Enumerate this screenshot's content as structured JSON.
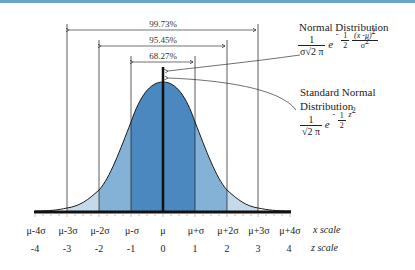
{
  "diagram": {
    "colors": {
      "band_1sigma": "#4a88bf",
      "band_2sigma": "#84b1d6",
      "band_3sigma": "#c4daea",
      "curve": "#1a1a1a",
      "top_border": "#6aa7c7"
    },
    "intervals": [
      {
        "label": "99.73%",
        "range": "μ±3σ"
      },
      {
        "label": "95.45%",
        "range": "μ±2σ"
      },
      {
        "label": "68.27%",
        "range": "μ±σ"
      }
    ],
    "x_scale": {
      "name": "x scale",
      "ticks": [
        "μ-4σ",
        "μ-3σ",
        "μ-2σ",
        "μ-σ",
        "μ",
        "μ+σ",
        "μ+2σ",
        "μ+3σ",
        "μ+4σ"
      ]
    },
    "z_scale": {
      "name": "z scale",
      "ticks": [
        "-4",
        "-3",
        "-2",
        "-1",
        "0",
        "1",
        "2",
        "3",
        "4"
      ]
    },
    "normal": {
      "title": "Normal Distribution",
      "num": "1",
      "den": "σ√2 π",
      "e": "e",
      "exp_sign": "-",
      "exp_frac_num": "1",
      "exp_frac_den": "2",
      "exp_num": "(x -μ)",
      "exp_num_pow": "2",
      "exp_den": "σ",
      "exp_den_pow": "2"
    },
    "standard": {
      "title_line1": "Standard Normal",
      "title_line2": "Distribution",
      "num": "1",
      "den": "√2 π",
      "e": "e",
      "exp_sign": "-",
      "exp_frac_num": "1",
      "exp_frac_den": "2",
      "exp_var": "z",
      "exp_pow": "2"
    }
  }
}
